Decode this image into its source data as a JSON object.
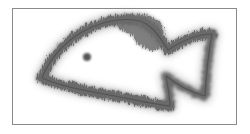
{
  "image": {
    "subject": "fish outline drawn with fuzzy, hair-like strokes",
    "frame_color": "#8a8a8a",
    "stroke_color": "#4a4a4a",
    "background_color": "#ffffff",
    "eye_color": "#555555",
    "elements": {
      "frame": "rectangular border",
      "fish_body": "fuzzy outline",
      "eye": "dark dot",
      "dorsal_blob": "dark shaded region on top of body",
      "tail": "forked tail outline"
    }
  }
}
